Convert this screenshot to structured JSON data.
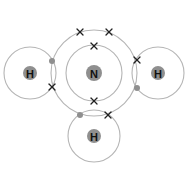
{
  "diagram": {
    "colors": {
      "shell": "#b5b5b5",
      "nucleus": "#8f8f8f",
      "cross": "#222222",
      "dot": "#8f8f8f",
      "label": "#111111"
    },
    "atoms": [
      {
        "id": "N",
        "label": "N",
        "cx": 94,
        "cy": 73,
        "nucleus_r": 8,
        "shells": [
          28,
          43
        ]
      },
      {
        "id": "H-left",
        "label": "H",
        "cx": 30,
        "cy": 73,
        "nucleus_r": 7,
        "shells": [
          26
        ]
      },
      {
        "id": "H-right",
        "label": "H",
        "cx": 158,
        "cy": 73,
        "nucleus_r": 7,
        "shells": [
          26
        ]
      },
      {
        "id": "H-bottom",
        "label": "H",
        "cx": 94,
        "cy": 136,
        "nucleus_r": 7,
        "shells": [
          26
        ]
      }
    ],
    "electrons": {
      "crosses": [
        {
          "x": 80,
          "y": 32
        },
        {
          "x": 109,
          "y": 32
        },
        {
          "x": 94,
          "y": 46
        },
        {
          "x": 94,
          "y": 101
        },
        {
          "x": 52,
          "y": 87
        },
        {
          "x": 137,
          "y": 60
        },
        {
          "x": 108,
          "y": 115
        }
      ],
      "dots": [
        {
          "x": 52,
          "y": 61
        },
        {
          "x": 137,
          "y": 88
        },
        {
          "x": 80,
          "y": 115
        }
      ]
    }
  }
}
